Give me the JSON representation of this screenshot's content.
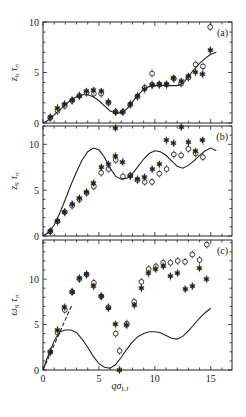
{
  "figure": {
    "xlabel_main": "qσ",
    "xlabel_sub": "LJ",
    "x_ticks": [
      0,
      5,
      10,
      15
    ],
    "xlim": [
      0,
      16.9
    ]
  },
  "chart_data": [
    {
      "type": "scatter",
      "panel_label": "(a)",
      "ylabel_main": "ɀ",
      "ylabel": "z_h τ_σ",
      "ylim": [
        0,
        10
      ],
      "y_ticks": [
        0,
        5,
        10
      ],
      "xlabel": "qσ_LJ",
      "legend": "none",
      "series": [
        {
          "name": "open circles",
          "marker": "open-circle",
          "x": [
            0.65,
            1.3,
            1.95,
            2.6,
            3.25,
            3.9,
            4.55,
            5.2,
            5.85,
            6.5,
            7.15,
            7.8,
            8.45,
            9.1,
            9.75,
            9.75,
            10.4,
            11.05,
            11.7,
            12.35,
            13.0,
            13.65,
            14.3,
            14.95
          ],
          "y": [
            0.5,
            1.2,
            1.7,
            2.2,
            2.7,
            3.0,
            2.9,
            2.9,
            2.0,
            1.1,
            1.1,
            1.8,
            2.6,
            3.5,
            4.9,
            3.8,
            3.8,
            3.8,
            4.4,
            3.9,
            4.5,
            5.8,
            5.6,
            9.5
          ]
        },
        {
          "name": "stars",
          "marker": "star",
          "x": [
            0.65,
            1.3,
            1.95,
            2.6,
            3.25,
            3.9,
            4.55,
            5.2,
            5.85,
            6.5,
            7.15,
            7.8,
            8.45,
            9.1,
            9.75,
            10.4,
            11.05,
            11.7,
            12.35,
            13.0,
            13.65,
            14.3,
            14.95
          ],
          "y": [
            0.6,
            1.5,
            1.9,
            2.3,
            2.7,
            3.1,
            3.2,
            3.1,
            2.1,
            1.1,
            1.1,
            1.9,
            2.7,
            3.3,
            3.7,
            3.8,
            3.8,
            4.4,
            4.1,
            4.6,
            5.0,
            4.8,
            7.2
          ]
        },
        {
          "name": "theory",
          "marker": "line-solid",
          "x": [
            0,
            0.5,
            1,
            1.5,
            2,
            2.5,
            3,
            3.5,
            4,
            4.5,
            5,
            5.5,
            6,
            6.5,
            7,
            7.5,
            8,
            8.5,
            9,
            9.5,
            10,
            10.5,
            11,
            11.5,
            12,
            12.5,
            13,
            13.5,
            14,
            14.5,
            15,
            15.5
          ],
          "y": [
            0,
            0.3,
            0.8,
            1.3,
            1.8,
            2.3,
            2.6,
            2.8,
            2.8,
            2.6,
            2.2,
            1.7,
            1.2,
            1.0,
            1.0,
            1.4,
            2.1,
            2.8,
            3.3,
            3.6,
            3.7,
            3.7,
            3.7,
            3.7,
            3.7,
            3.9,
            4.6,
            5.3,
            5.9,
            6.4,
            6.8,
            7.0
          ]
        }
      ]
    },
    {
      "type": "scatter",
      "panel_label": "(b)",
      "ylabel": "z_S τ_σ",
      "ylim": [
        0,
        12
      ],
      "y_ticks": [
        0,
        5,
        10
      ],
      "xlabel": "qσ_LJ",
      "legend": "none",
      "series": [
        {
          "name": "open circles",
          "marker": "open-circle",
          "x": [
            0.65,
            1.3,
            1.95,
            2.6,
            3.25,
            3.9,
            4.55,
            5.2,
            5.85,
            6.5,
            7.15,
            7.8,
            8.45,
            9.1,
            9.75,
            10.4,
            11.05,
            11.7,
            12.35,
            13.0,
            13.65,
            14.3
          ],
          "y": [
            0.5,
            1.6,
            2.6,
            3.3,
            4.0,
            4.7,
            5.4,
            6.9,
            7.3,
            8.3,
            6.5,
            6.6,
            6.1,
            5.9,
            5.9,
            6.8,
            7.3,
            8.9,
            8.8,
            9.5,
            9.0,
            8.6
          ]
        },
        {
          "name": "stars",
          "marker": "star",
          "x": [
            0.65,
            1.3,
            1.95,
            2.6,
            3.25,
            3.9,
            4.55,
            5.2,
            5.85,
            6.5,
            6.5,
            7.15,
            7.8,
            8.45,
            9.1,
            9.75,
            10.4,
            11.05,
            11.7,
            12.35,
            13.0,
            13.65,
            14.3
          ],
          "y": [
            0.5,
            1.6,
            2.6,
            3.5,
            4.1,
            4.8,
            5.8,
            7.5,
            7.8,
            8.7,
            11.8,
            8.1,
            6.5,
            6.2,
            6.4,
            7.3,
            7.8,
            10.4,
            10.1,
            11.9,
            10.2,
            9.2,
            10.4
          ]
        },
        {
          "name": "theory",
          "marker": "line-solid",
          "x": [
            0,
            0.5,
            1,
            1.5,
            2,
            2.5,
            3,
            3.5,
            4,
            4.5,
            5,
            5.5,
            6,
            6.5,
            7,
            7.5,
            8,
            8.5,
            9,
            9.5,
            10,
            10.5,
            11,
            11.5,
            12,
            12.5,
            13,
            13.5,
            14,
            14.5,
            15,
            15.5
          ],
          "y": [
            0,
            0.4,
            1.2,
            2.5,
            4.0,
            5.6,
            7.0,
            8.3,
            9.2,
            9.6,
            9.4,
            8.6,
            7.4,
            6.5,
            6.2,
            6.3,
            6.8,
            7.6,
            8.4,
            9.0,
            9.3,
            9.2,
            8.8,
            8.2,
            7.6,
            7.4,
            7.7,
            8.2,
            8.8,
            9.3,
            9.6,
            9.3
          ]
        }
      ]
    },
    {
      "type": "scatter",
      "panel_label": "(c)",
      "ylabel": "ω_S τ_σ",
      "ylim": [
        0,
        14.3
      ],
      "y_ticks": [
        0,
        5,
        10
      ],
      "xlabel": "qσ_LJ",
      "x_ticks": [
        0,
        5,
        10,
        15
      ],
      "legend": "none",
      "series": [
        {
          "name": "open circles",
          "marker": "open-circle",
          "x": [
            0.65,
            1.3,
            1.95,
            2.6,
            3.25,
            3.9,
            4.55,
            5.2,
            5.85,
            6.5,
            6.85,
            7.5,
            8.15,
            8.8,
            9.45,
            10.1,
            10.75,
            11.4,
            12.05,
            12.7,
            13.35,
            14.0,
            14.65
          ],
          "y": [
            2.0,
            4.1,
            6.6,
            8.6,
            10.0,
            10.5,
            9.6,
            8.1,
            6.9,
            4.0,
            2.1,
            5.1,
            7.5,
            9.7,
            11.1,
            11.4,
            11.8,
            11.8,
            12.0,
            11.9,
            12.7,
            12.1,
            13.8
          ]
        },
        {
          "name": "stars",
          "marker": "star",
          "x": [
            0.65,
            1.3,
            1.95,
            2.6,
            3.25,
            3.9,
            4.55,
            5.2,
            5.85,
            6.5,
            6.85,
            7.5,
            8.15,
            8.8,
            9.45,
            10.1,
            10.75,
            11.4,
            12.05,
            12.7,
            13.35,
            14.0,
            14.65
          ],
          "y": [
            2.0,
            4.4,
            6.9,
            8.6,
            10.1,
            10.5,
            9.2,
            8.1,
            6.8,
            5.0,
            0.0,
            4.9,
            7.1,
            9.0,
            10.6,
            11.1,
            11.4,
            10.3,
            10.7,
            8.9,
            9.2,
            11.2,
            10.0
          ]
        },
        {
          "name": "theory",
          "marker": "line-solid",
          "x": [
            0,
            0.5,
            1,
            1.5,
            2,
            2.5,
            3,
            3.5,
            4,
            4.5,
            5,
            5.5,
            6,
            6.5,
            7,
            7.5,
            8,
            8.5,
            9,
            9.5,
            10,
            10.5,
            11,
            11.5,
            12,
            12.5,
            13,
            13.5,
            14,
            14.5,
            15
          ],
          "y": [
            0,
            1.7,
            3.2,
            4.2,
            4.4,
            4.4,
            4.1,
            3.4,
            2.5,
            1.5,
            0.7,
            0.3,
            0.2,
            0.6,
            1.4,
            2.3,
            3.1,
            3.7,
            4.0,
            4.2,
            4.2,
            4.1,
            3.8,
            3.5,
            3.4,
            3.7,
            4.3,
            5.0,
            5.7,
            6.3,
            6.8
          ]
        },
        {
          "name": "slope",
          "marker": "line-dashed",
          "x": [
            0,
            2.6
          ],
          "y": [
            0,
            7.2
          ]
        }
      ]
    }
  ],
  "layout": {
    "plot_left": 43,
    "plot_right": 232,
    "panels": [
      {
        "top": 22,
        "bottom": 123
      },
      {
        "top": 126,
        "bottom": 236
      },
      {
        "top": 240,
        "bottom": 370
      }
    ]
  }
}
